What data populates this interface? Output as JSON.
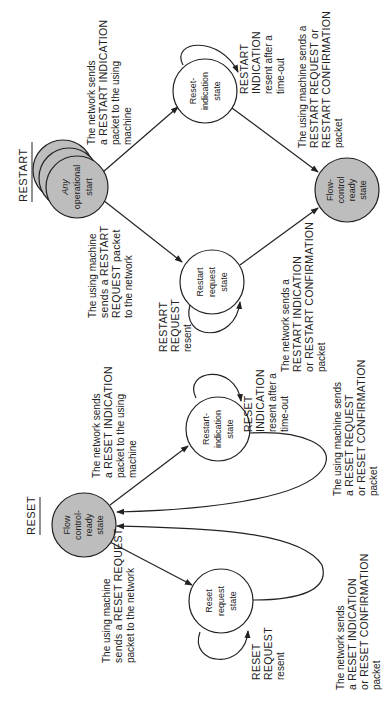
{
  "orientation": "rotated-90-ccw",
  "colors": {
    "shaded_state": "#bdbdbd",
    "plain_state": "#ffffff",
    "ink": "#222222"
  },
  "restart": {
    "title": "RESTART",
    "states": {
      "any_operational_start": [
        "Any",
        "operational",
        "start"
      ],
      "reset_indication": [
        "Reset-",
        "indication",
        "state"
      ],
      "restart_request": [
        "Restart",
        "request",
        "state"
      ],
      "flow_control_ready": [
        "Flow-",
        "control",
        "ready",
        "state"
      ]
    },
    "labels": {
      "network_sends_indication": [
        "The network sends",
        "a RESTART INDICATION",
        "packet to the using",
        "machine"
      ],
      "indication_resent": [
        "RESTART",
        "INDICATION",
        "resent after a",
        "time-out"
      ],
      "machine_sends_confirm": [
        "The using machine sends a",
        "RESTART REQUEST or",
        "RESTART CONFIRMATION",
        "packet"
      ],
      "machine_sends_request": [
        "The using machine",
        "sends a RESTART",
        "REQUEST packet",
        "to the network"
      ],
      "request_resent": [
        "RESTART",
        "REQUEST",
        "resent"
      ],
      "network_sends_confirm": [
        "The network sends a",
        "RESTART INDICATION",
        "or RESTART CONFIRMATION",
        "packet"
      ]
    }
  },
  "reset": {
    "title": "RESET",
    "states": {
      "flow_control_ready": [
        "Flow",
        "control-",
        "ready",
        "state"
      ],
      "restart_indication": [
        "Restart-",
        "indication",
        "state"
      ],
      "reset_request": [
        "Reset",
        "request",
        "state"
      ]
    },
    "labels": {
      "network_sends_indication": [
        "The network sends",
        "a RESET INDICATION",
        "packet to the using",
        "machine"
      ],
      "indication_resent": [
        "RESET",
        "INDICATION",
        "resent after a",
        "time-out"
      ],
      "machine_sends_confirm": [
        "The using machine sends",
        "a RESET REQUEST",
        "or RESET CONFIRMATION",
        "packet"
      ],
      "machine_sends_request": [
        "The using machine",
        "sends a RESET REQUEST",
        "packet to the network"
      ],
      "request_resent": [
        "RESET",
        "REQUEST",
        "resent"
      ],
      "network_sends_confirm": [
        "The network sends",
        "a RESET INDICATION",
        "or RESET CONFIRMATION",
        "packet"
      ]
    }
  }
}
